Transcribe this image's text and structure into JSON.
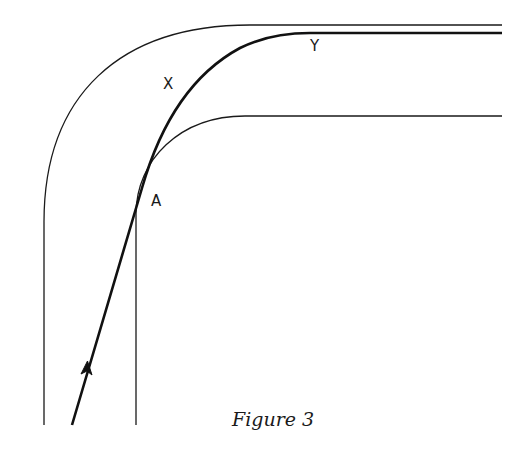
{
  "figure": {
    "caption": "Figure 3",
    "labels": {
      "x": "X",
      "y": "Y",
      "a": "A"
    }
  },
  "colors": {
    "background": "#ffffff",
    "ink": "#1a1a1a"
  },
  "elements": {
    "outer_edge": "outer track boundary",
    "inner_edge": "inner track boundary",
    "racing_line": "driving line with direction arrow"
  }
}
